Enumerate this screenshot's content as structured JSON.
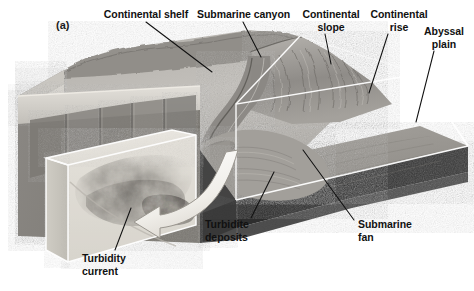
{
  "figure": {
    "panel_letter": "(a)",
    "type": "block-diagram",
    "background_color": "#ffffff",
    "ink_color": "#111111"
  },
  "labels": [
    {
      "id": "continental-shelf",
      "text": "Continental shelf",
      "lines": [
        "Continental shelf"
      ],
      "x": 100,
      "y": 8,
      "w": 92,
      "align": "center",
      "leader": {
        "x1": 146,
        "y1": 22,
        "x2": 212,
        "y2": 72
      }
    },
    {
      "id": "submarine-canyon",
      "text": "Submarine canyon",
      "lines": [
        "Submarine canyon"
      ],
      "x": 197,
      "y": 8,
      "w": 92,
      "align": "center",
      "leader": {
        "x1": 243,
        "y1": 22,
        "x2": 261,
        "y2": 57
      }
    },
    {
      "id": "continental-slope",
      "text": "Continental slope",
      "lines": [
        "Continental",
        "slope"
      ],
      "x": 300,
      "y": 8,
      "w": 62,
      "align": "center",
      "leader": {
        "x1": 325,
        "y1": 34,
        "x2": 331,
        "y2": 64
      }
    },
    {
      "id": "continental-rise",
      "text": "Continental rise",
      "lines": [
        "Continental",
        "rise"
      ],
      "x": 368,
      "y": 8,
      "w": 62,
      "align": "center",
      "leader": {
        "x1": 388,
        "y1": 34,
        "x2": 369,
        "y2": 93
      }
    },
    {
      "id": "abyssal-plain",
      "text": "Abyssal plain",
      "lines": [
        "Abyssal",
        "plain"
      ],
      "x": 420,
      "y": 25,
      "w": 48,
      "align": "center",
      "leader": {
        "x1": 434,
        "y1": 51,
        "x2": 416,
        "y2": 122
      }
    },
    {
      "id": "turbidite-deposits",
      "text": "Turbidite deposits",
      "lines": [
        "Turbidite",
        "deposits"
      ],
      "x": 205,
      "y": 218,
      "w": 48,
      "align": "left",
      "leader": {
        "x1": 251,
        "y1": 218,
        "x2": 274,
        "y2": 172
      }
    },
    {
      "id": "submarine-fan",
      "text": "Submarine fan",
      "lines": [
        "Submarine",
        "fan"
      ],
      "x": 358,
      "y": 218,
      "w": 54,
      "align": "left",
      "leader": {
        "x1": 354,
        "y1": 220,
        "x2": 303,
        "y2": 150
      }
    },
    {
      "id": "turbidity-current",
      "text": "Turbidity current",
      "lines": [
        "Turbidity",
        "current"
      ],
      "x": 82,
      "y": 252,
      "w": 56,
      "align": "left",
      "leader": {
        "x1": 115,
        "y1": 250,
        "x2": 131,
        "y2": 208
      }
    }
  ],
  "scene": {
    "arrow": {
      "id": "turbidity-flow-arrow",
      "color": "#f2f0ec",
      "direction": "right-to-left-curved"
    },
    "inset_block": {
      "id": "turbidity-current-inset",
      "description": "cutaway cube showing turbidity current cloud"
    },
    "layers": [
      {
        "name": "shelf-surface",
        "color": "#b9b6b1"
      },
      {
        "name": "slope-gullies",
        "color": "#a19e99"
      },
      {
        "name": "abyssal-plain-floor",
        "color": "#9b9893"
      },
      {
        "name": "sediment-wedge",
        "color": "#cfccc6"
      },
      {
        "name": "basement-rock",
        "color": "#2a2a2a"
      },
      {
        "name": "cut-face-rock",
        "color": "#8d8a86"
      }
    ]
  }
}
